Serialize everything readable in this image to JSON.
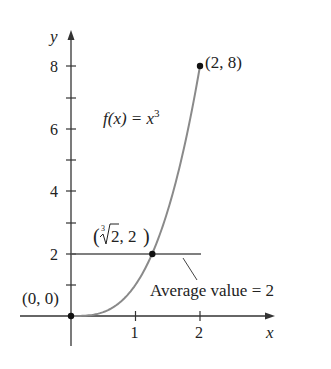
{
  "chart_data": {
    "type": "line",
    "title": "",
    "xlabel": "x",
    "ylabel": "y",
    "xlim": [
      0,
      2.6
    ],
    "ylim": [
      0,
      8.6
    ],
    "grid": false,
    "x_ticks": [
      1,
      2
    ],
    "x_tick_labels": [
      "1",
      "2"
    ],
    "y_ticks": [
      1,
      2,
      3,
      4,
      5,
      6,
      7,
      8
    ],
    "y_tick_labels": [
      "",
      "2",
      "",
      "4",
      "",
      "6",
      "",
      "8"
    ],
    "series": [
      {
        "name": "f(x) = x^3",
        "function": "x^3",
        "domain": [
          0,
          2
        ],
        "x": [
          0,
          0.25,
          0.5,
          0.75,
          1.0,
          1.25,
          1.5,
          1.75,
          2.0
        ],
        "y": [
          0,
          0.016,
          0.125,
          0.422,
          1.0,
          1.953,
          3.375,
          5.359,
          8.0
        ],
        "color": "#808080"
      },
      {
        "name": "Average value = 2",
        "type": "hline",
        "y": 2,
        "x_range": [
          0,
          2
        ],
        "color": "#555555"
      }
    ],
    "points": [
      {
        "x": 0,
        "y": 0,
        "label": "(0, 0)"
      },
      {
        "x": 1.26,
        "y": 2,
        "label": "(∛2, 2)"
      },
      {
        "x": 2,
        "y": 8,
        "label": "(2, 8)"
      }
    ],
    "annotations": [
      {
        "text": "f(x) = x³",
        "near": "curve"
      },
      {
        "text": "Average value = 2",
        "near": "horizontal line",
        "leader_line": true
      }
    ]
  },
  "labels": {
    "y_axis": "y",
    "x_axis": "x",
    "tick_x1": "1",
    "tick_x2": "2",
    "tick_y2": "2",
    "tick_y4": "4",
    "tick_y6": "6",
    "tick_y8": "8",
    "func_prefix": "f(x) = x",
    "func_exp": "3",
    "pt_origin": "(0, 0)",
    "pt_end": "(2, 8)",
    "pt_mid_index": "3",
    "pt_mid_radicand": "2, 2",
    "avg_label": "Average value = 2"
  }
}
